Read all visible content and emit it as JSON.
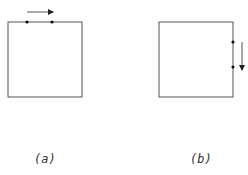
{
  "colors": {
    "stroke": "#555555",
    "dot": "#111111",
    "arrow": "#555555",
    "label": "#333333"
  },
  "panels": [
    {
      "label": "(a)",
      "box": {
        "x": 8,
        "y": 22,
        "w": 74,
        "h": 75
      },
      "dots": [
        {
          "x": 27,
          "y": 22
        },
        {
          "x": 52,
          "y": 22
        }
      ],
      "arrow": {
        "x1": 27,
        "y1": 12,
        "x2": 53,
        "y2": 12,
        "direction": "right"
      }
    },
    {
      "label": "(b)",
      "box": {
        "x": 159,
        "y": 22,
        "w": 74,
        "h": 75
      },
      "dots": [
        {
          "x": 233,
          "y": 42
        },
        {
          "x": 233,
          "y": 67
        }
      ],
      "arrow": {
        "x1": 242,
        "y1": 42,
        "x2": 242,
        "y2": 70,
        "direction": "down"
      }
    }
  ]
}
